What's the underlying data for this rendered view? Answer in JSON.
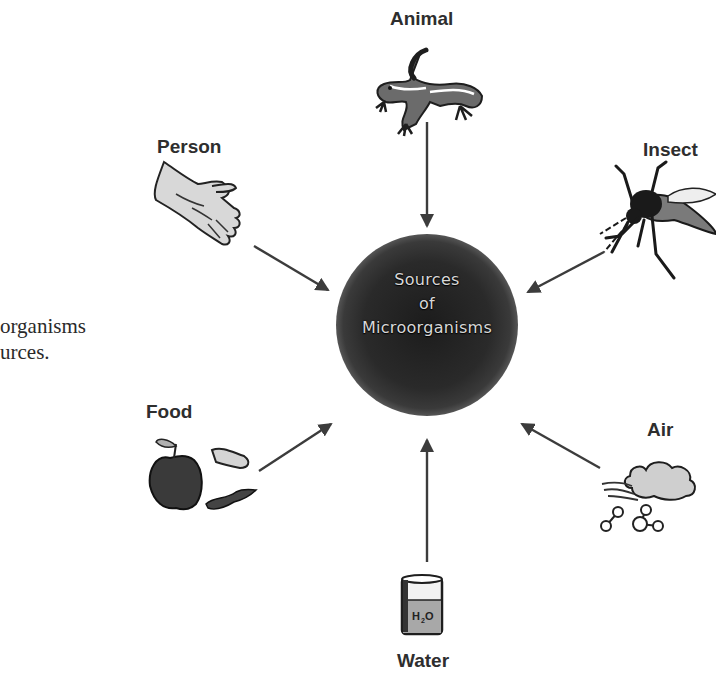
{
  "side_text": {
    "line1": "organisms",
    "line2": "urces."
  },
  "center": {
    "line1": "Sources",
    "line2": "of",
    "line3": "Microorganisms",
    "fill_color": "#2a2a2a"
  },
  "sources": [
    {
      "label": "Animal",
      "icon": "lizard-icon"
    },
    {
      "label": "Person",
      "icon": "hand-icon"
    },
    {
      "label": "Insect",
      "icon": "mosquito-icon"
    },
    {
      "label": "Food",
      "icon": "apple-icon"
    },
    {
      "label": "Air",
      "icon": "cloud-icon"
    },
    {
      "label": "Water",
      "icon": "beaker-icon"
    }
  ],
  "colors": {
    "arrow": "#3c3c3c",
    "label": "#2e2e2e",
    "background": "#ffffff"
  }
}
